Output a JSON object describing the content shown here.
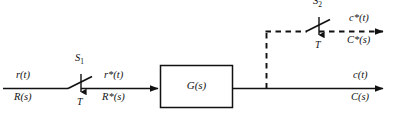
{
  "diagram": {
    "colors": {
      "line": "#111111",
      "background": "#ffffff",
      "text": "#111111"
    },
    "input": {
      "time_label": "r(t)",
      "laplace_label": "R(s)"
    },
    "sampler_1": {
      "name_label": "S",
      "name_subscript": "1",
      "period_label": "T"
    },
    "sampled_input": {
      "time_label": "r*(t)",
      "laplace_label": "R*(s)"
    },
    "plant_block": {
      "label": "G(s)"
    },
    "output": {
      "time_label": "c(t)",
      "laplace_label": "C(s)"
    },
    "sampler_2": {
      "name_label": "S",
      "name_subscript": "2",
      "period_label": "T"
    },
    "sampled_output": {
      "time_label": "c*(t)",
      "laplace_label": "C*(s)"
    }
  }
}
